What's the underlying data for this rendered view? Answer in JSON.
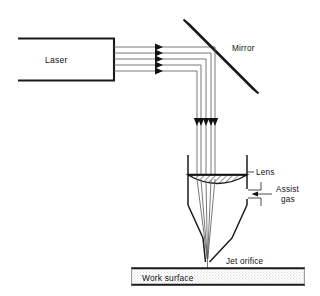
{
  "diagram": {
    "background_color": "#ffffff",
    "line_color": "#1a1a1a",
    "beam_color": "#555555",
    "labels": {
      "laser": "Laser",
      "mirror": "Mirror",
      "lens": "Lens",
      "assist_gas_line1": "Assist",
      "assist_gas_line2": "gas",
      "jet_orifice": "Jet orifice",
      "work_surface": "Work surface"
    },
    "components": [
      {
        "name": "laser-source",
        "label": "Laser",
        "shape": "open-rectangle"
      },
      {
        "name": "mirror",
        "label": "Mirror",
        "shape": "tilted-bar",
        "angle_deg": 45
      },
      {
        "name": "lens",
        "label": "Lens",
        "shape": "plano-convex-hatched"
      },
      {
        "name": "assist-gas-port",
        "label": "Assist gas",
        "shape": "side-inlet-arrow"
      },
      {
        "name": "jet-orifice",
        "label": "Jet orifice",
        "shape": "nozzle-tip"
      },
      {
        "name": "work-surface",
        "label": "Work surface",
        "shape": "hatched-bar"
      }
    ],
    "beams": {
      "horizontal_count": 5,
      "vertical_count": 5,
      "converging": true,
      "horizontal_arrow_x": 160,
      "vertical_arrow_y": 124
    }
  }
}
